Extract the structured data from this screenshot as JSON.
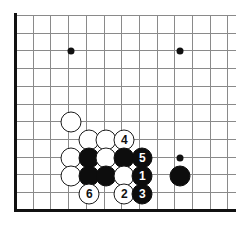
{
  "diagram": {
    "type": "go-board-diagram",
    "board": {
      "origin_x": 15,
      "origin_y": 15,
      "spacing": 17.7,
      "cols_visible": 13,
      "rows_visible": 12,
      "line_color": "#8a8a8a",
      "edge_color": "#111111",
      "background": "#ffffff"
    },
    "star_points": [
      {
        "name": "star-point-upper-left",
        "x": 71,
        "y": 51
      },
      {
        "name": "star-point-upper-right",
        "x": 180,
        "y": 51
      },
      {
        "name": "star-point-lower-right",
        "x": 180,
        "y": 158
      }
    ],
    "stones": [
      {
        "name": "white-stone-1",
        "color": "white",
        "label": "",
        "x": 71,
        "y": 122
      },
      {
        "name": "white-stone-2",
        "color": "white",
        "label": "",
        "x": 89,
        "y": 140
      },
      {
        "name": "white-stone-3",
        "color": "white",
        "label": "",
        "x": 106,
        "y": 140
      },
      {
        "name": "white-move-4",
        "color": "white",
        "label": "4",
        "x": 124,
        "y": 140
      },
      {
        "name": "white-stone-4",
        "color": "white",
        "label": "",
        "x": 71,
        "y": 158
      },
      {
        "name": "black-stone-1",
        "color": "black",
        "label": "",
        "x": 89,
        "y": 158
      },
      {
        "name": "white-stone-5",
        "color": "white",
        "label": "",
        "x": 106,
        "y": 158
      },
      {
        "name": "black-stone-2",
        "color": "black",
        "label": "",
        "x": 124,
        "y": 158
      },
      {
        "name": "black-move-5",
        "color": "black",
        "label": "5",
        "x": 142,
        "y": 158
      },
      {
        "name": "white-stone-6",
        "color": "white",
        "label": "",
        "x": 71,
        "y": 176
      },
      {
        "name": "black-stone-3",
        "color": "black",
        "label": "",
        "x": 89,
        "y": 176
      },
      {
        "name": "black-stone-4",
        "color": "black",
        "label": "",
        "x": 106,
        "y": 176
      },
      {
        "name": "white-stone-7",
        "color": "white",
        "label": "",
        "x": 124,
        "y": 176
      },
      {
        "name": "black-move-1",
        "color": "black",
        "label": "1",
        "x": 142,
        "y": 176
      },
      {
        "name": "black-stone-5",
        "color": "black",
        "label": "",
        "x": 180,
        "y": 176
      },
      {
        "name": "white-move-6",
        "color": "white",
        "label": "6",
        "x": 89,
        "y": 194
      },
      {
        "name": "white-move-2",
        "color": "white",
        "label": "2",
        "x": 124,
        "y": 194
      },
      {
        "name": "black-move-3",
        "color": "black",
        "label": "3",
        "x": 142,
        "y": 194
      }
    ],
    "colors": {
      "black_stone": "#0d0d0d",
      "white_stone": "#ffffff",
      "stone_outline": "#1a1a1a",
      "grid": "#8a8a8a",
      "edge": "#111111"
    }
  }
}
